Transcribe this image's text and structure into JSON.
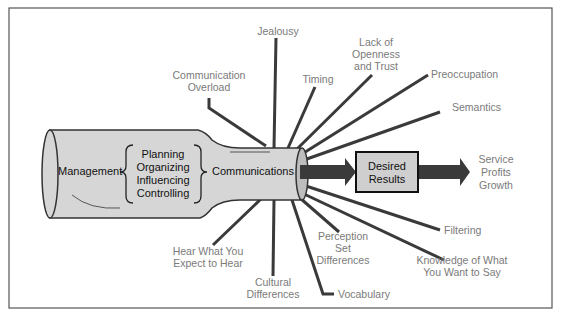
{
  "diagram": {
    "bottle": {
      "source_label": "Management",
      "functions": [
        "Planning",
        "Organizing",
        "Influencing",
        "Controlling"
      ],
      "neck_label": "Communications"
    },
    "result_box": {
      "lines": [
        "Desired",
        "Results"
      ]
    },
    "outcomes": [
      "Service",
      "Profits",
      "Growth"
    ],
    "barriers": {
      "communication_overload": [
        "Communication",
        "Overload"
      ],
      "jealousy": [
        "Jealousy"
      ],
      "timing": [
        "Timing"
      ],
      "lack_of_openness": [
        "Lack of",
        "Openness",
        "and Trust"
      ],
      "preoccupation": [
        "Preoccupation"
      ],
      "semantics": [
        "Semantics"
      ],
      "filtering": [
        "Filtering"
      ],
      "knowledge": [
        "Knowledge of What",
        "You Want to Say"
      ],
      "vocabulary": [
        "Vocabulary"
      ],
      "perception": [
        "Perception",
        "Set",
        "Differences"
      ],
      "cultural": [
        "Cultural",
        "Differences"
      ],
      "hear_what": [
        "Hear What You",
        "Expect to Hear"
      ]
    },
    "colors": {
      "bottle_fill": "#d6d6d6",
      "line": "#3a3a3a",
      "label_text": "#7a7a7a",
      "box_fill": "#cfcfcf"
    }
  }
}
